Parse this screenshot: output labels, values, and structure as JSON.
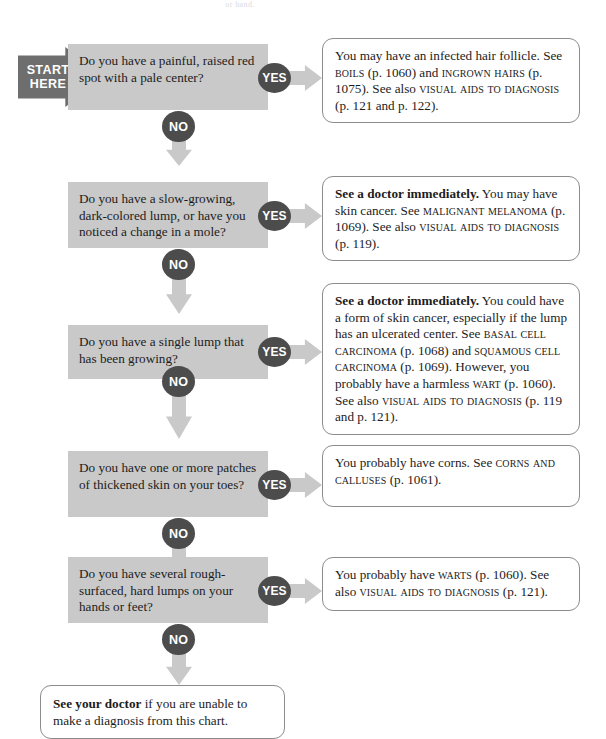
{
  "page": {
    "top_cropped_text": "or hand.",
    "start_label_line1": "START",
    "start_label_line2": "HERE",
    "yes_label": "YES",
    "no_label": "NO"
  },
  "colors": {
    "question_box_bg": "#c9c9c9",
    "badge_bg": "#4c4c4c",
    "arrow_gray": "#c9c9c9",
    "start_arrow_bg": "#6e6e6e",
    "answer_border": "#8c8c8c",
    "page_bg": "#ffffff",
    "text": "#1c1c1c"
  },
  "flow": {
    "rows": [
      {
        "id": "row-1",
        "question": "Do you have a painful, raised red spot with a pale center?",
        "yes": "YES",
        "no": "NO",
        "answer_parts": [
          {
            "text": "You may have an infected hair follicle. See ",
            "style": "normal"
          },
          {
            "text": "boils",
            "style": "smallcaps"
          },
          {
            "text": " (p. 1060) and ",
            "style": "normal"
          },
          {
            "text": "ingrown hairs",
            "style": "smallcaps"
          },
          {
            "text": " (p. 1075). See also ",
            "style": "normal"
          },
          {
            "text": "visual aids to diagnosis",
            "style": "smallcaps"
          },
          {
            "text": " (p. 121 and p. 122).",
            "style": "normal"
          }
        ]
      },
      {
        "id": "row-2",
        "question": "Do you have a slow-growing, dark-colored lump, or have you noticed a change in a mole?",
        "yes": "YES",
        "no": "NO",
        "answer_parts": [
          {
            "text": "See a doctor immediately.",
            "style": "bold"
          },
          {
            "text": " You may have skin cancer. See ",
            "style": "normal"
          },
          {
            "text": "malignant melanoma",
            "style": "smallcaps"
          },
          {
            "text": " (p. 1069). See also ",
            "style": "normal"
          },
          {
            "text": "visual aids to diagnosis",
            "style": "smallcaps"
          },
          {
            "text": " (p. 119).",
            "style": "normal"
          }
        ]
      },
      {
        "id": "row-3",
        "question": "Do you have a single lump that has been growing?",
        "yes": "YES",
        "no": "NO",
        "answer_parts": [
          {
            "text": "See a doctor immediately.",
            "style": "bold"
          },
          {
            "text": " You could have a form of skin cancer, especially if the lump has an ulcerated center. See ",
            "style": "normal"
          },
          {
            "text": "basal cell carcinoma",
            "style": "smallcaps"
          },
          {
            "text": " (p. 1068) and ",
            "style": "normal"
          },
          {
            "text": "squamous cell carcinoma",
            "style": "smallcaps"
          },
          {
            "text": " (p. 1069). However, you probably have a harmless ",
            "style": "normal"
          },
          {
            "text": "wart",
            "style": "smallcaps"
          },
          {
            "text": " (p. 1060). See also ",
            "style": "normal"
          },
          {
            "text": "visual aids to diagnosis",
            "style": "smallcaps"
          },
          {
            "text": " (p. 119 and p. 121).",
            "style": "normal"
          }
        ]
      },
      {
        "id": "row-4",
        "question": "Do you have one or more patches of thickened skin on your toes?",
        "yes": "YES",
        "no": "NO",
        "answer_parts": [
          {
            "text": "You probably have corns. See ",
            "style": "normal"
          },
          {
            "text": "corns and calluses",
            "style": "smallcaps"
          },
          {
            "text": " (p. 1061).",
            "style": "normal"
          }
        ]
      },
      {
        "id": "row-5",
        "question": "Do you have several rough-surfaced, hard lumps on your hands or feet?",
        "yes": "YES",
        "no": "NO",
        "answer_parts": [
          {
            "text": "You probably have ",
            "style": "normal"
          },
          {
            "text": "warts",
            "style": "smallcaps"
          },
          {
            "text": " (p. 1060). See also ",
            "style": "normal"
          },
          {
            "text": "visual aids to diagnosis",
            "style": "smallcaps"
          },
          {
            "text": " (p. 121).",
            "style": "normal"
          }
        ]
      }
    ],
    "final": {
      "id": "final-box",
      "parts": [
        {
          "text": "See your doctor",
          "style": "bold"
        },
        {
          "text": " if you are unable to make a diagnosis from this chart.",
          "style": "normal"
        }
      ]
    }
  },
  "layout": {
    "rows": [
      {
        "q_top": 44,
        "q_height": 66,
        "a_top": 38,
        "a_height": 80,
        "badge_top": 63,
        "no_top": 111,
        "varrow_top": 118,
        "varrow_height": 48
      },
      {
        "q_top": 182,
        "q_height": 66,
        "a_top": 176,
        "a_height": 80,
        "badge_top": 201,
        "no_top": 249,
        "varrow_top": 256,
        "varrow_height": 58
      },
      {
        "q_top": 325,
        "q_height": 54,
        "a_top": 283,
        "a_height": 120,
        "badge_top": 337,
        "no_top": 366,
        "varrow_top": 373,
        "varrow_height": 66
      },
      {
        "q_top": 451,
        "q_height": 66,
        "a_top": 445,
        "a_height": 62,
        "badge_top": 470,
        "no_top": 518,
        "varrow_top": 525,
        "varrow_height": 50
      },
      {
        "q_top": 557,
        "q_height": 66,
        "a_top": 557,
        "a_height": 54,
        "badge_top": 576,
        "no_top": 624,
        "varrow_top": 631,
        "varrow_height": 54
      }
    ],
    "q_left": 68,
    "q_width": 200,
    "badge_left": 258,
    "harrow_left": 277,
    "harrow_width": 45,
    "a_left": 322,
    "a_width": 258,
    "no_left": 162,
    "varrow_left": 166,
    "start_left": 18,
    "start_top": 47,
    "final_left": 40,
    "final_top": 685,
    "final_width": 245,
    "final_height": 46
  }
}
